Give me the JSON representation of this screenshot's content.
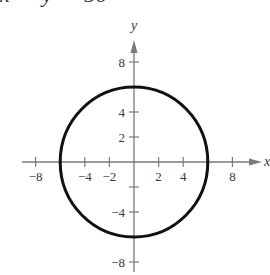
{
  "header": {
    "clipped_equation": "x² + y² = 36"
  },
  "chart_data": {
    "type": "line",
    "title": "",
    "xlabel": "x",
    "ylabel": "y",
    "xlim": [
      -9,
      10
    ],
    "ylim": [
      -9,
      10
    ],
    "grid": false,
    "legend": null,
    "x_ticks": [
      -8,
      -4,
      -2,
      2,
      4,
      8
    ],
    "y_ticks": [
      8,
      4,
      2,
      -4,
      -8
    ],
    "x_tick_labels": [
      "−8",
      "−4",
      "−2",
      "2",
      "4",
      "8"
    ],
    "y_tick_labels": [
      "8",
      "4",
      "2",
      "−4",
      "−8"
    ],
    "extra_ticks": {
      "x": [],
      "y": [
        -2
      ]
    },
    "series": [
      {
        "name": "circle",
        "equation": "x^2 + y^2 = 36",
        "shape": "circle",
        "center": [
          0,
          0
        ],
        "radius": 6,
        "color": "#111111"
      }
    ]
  },
  "colors": {
    "axis": "#7a7a7a",
    "curve": "#111111",
    "text": "#3a3a3a"
  }
}
